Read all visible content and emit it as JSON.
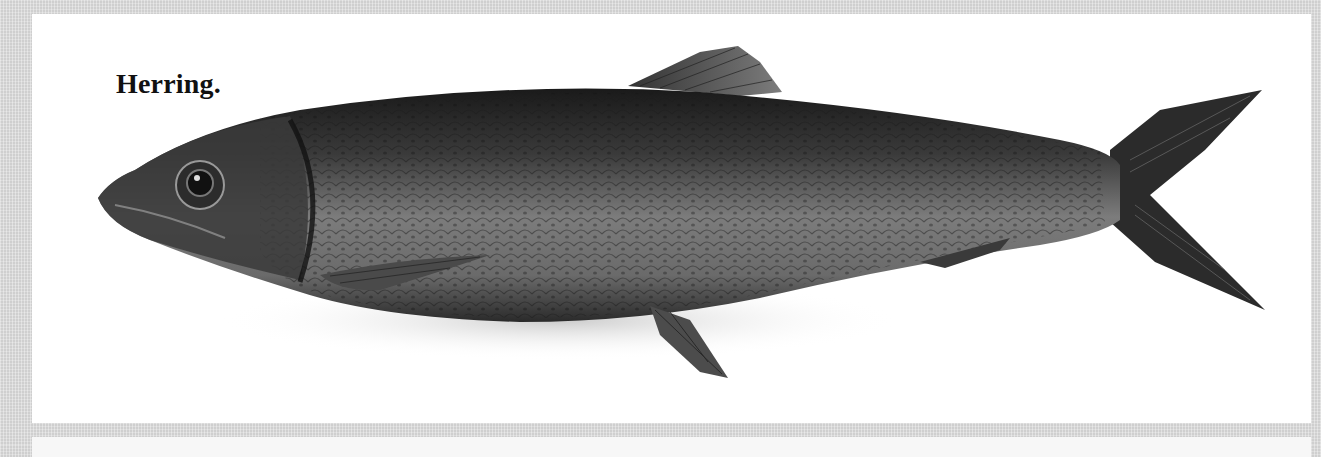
{
  "figure": {
    "caption": "Herring.",
    "style": "grayscale engraving",
    "colors": {
      "frame": "#cfcfcf",
      "panel": "#ffffff",
      "fish_dark": "#1e1e1e",
      "fish_mid": "#5a5a5a",
      "fish_light": "#9a9a9a",
      "caption_text": "#111111"
    }
  }
}
